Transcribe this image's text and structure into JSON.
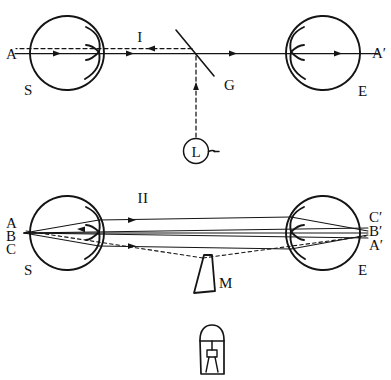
{
  "figure": {
    "background_color": "#ffffff",
    "ink_color": "#151515",
    "corner_note": "",
    "panels": [
      {
        "id": "panel-1",
        "roman_label": "I",
        "labels": {
          "left_axis_point": "A",
          "left_eye": "S",
          "right_axis_point": "A′",
          "right_eye": "E",
          "beam_splitter": "G",
          "lamp": "L"
        }
      },
      {
        "id": "panel-2",
        "roman_label": "II",
        "labels": {
          "left_point_top": "A",
          "left_point_mid": "B",
          "left_point_bottom": "C",
          "left_eye": "S",
          "right_point_top": "C′",
          "right_point_mid": "B′",
          "right_point_bottom": "A′",
          "right_eye": "E",
          "object": "M"
        }
      }
    ],
    "elements": {
      "lamp_glyph": "L",
      "roman_one": "I",
      "roman_two": "II"
    }
  }
}
